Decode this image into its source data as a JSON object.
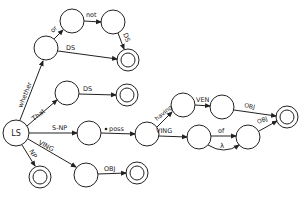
{
  "diagram": {
    "type": "augmented transition network",
    "stroke_color": "#222222",
    "background": "#ffffff",
    "nodes": [
      {
        "id": "LS",
        "label": "LS",
        "x": 16,
        "y": 133,
        "r": 13,
        "final": false
      },
      {
        "id": "n1",
        "label": "",
        "x": 46,
        "y": 48,
        "r": 12,
        "final": false
      },
      {
        "id": "n2",
        "label": "",
        "x": 72,
        "y": 21,
        "r": 12,
        "final": false
      },
      {
        "id": "n3",
        "label": "",
        "x": 113,
        "y": 22,
        "r": 12,
        "final": false
      },
      {
        "id": "f1",
        "label": "",
        "x": 128,
        "y": 60,
        "r": 11,
        "final": true
      },
      {
        "id": "n4",
        "label": "",
        "x": 67,
        "y": 93,
        "r": 12,
        "final": false
      },
      {
        "id": "f2",
        "label": "",
        "x": 127,
        "y": 95,
        "r": 11,
        "final": true
      },
      {
        "id": "n5",
        "label": "",
        "x": 89,
        "y": 133,
        "r": 12,
        "final": false
      },
      {
        "id": "n6",
        "label": "",
        "x": 147,
        "y": 134,
        "r": 12,
        "final": false
      },
      {
        "id": "n7",
        "label": "",
        "x": 183,
        "y": 105,
        "r": 12,
        "final": false
      },
      {
        "id": "n8",
        "label": "",
        "x": 222,
        "y": 107,
        "r": 12,
        "final": false
      },
      {
        "id": "f3",
        "label": "",
        "x": 287,
        "y": 117,
        "r": 11,
        "final": true
      },
      {
        "id": "n9",
        "label": "",
        "x": 199,
        "y": 137,
        "r": 12,
        "final": false
      },
      {
        "id": "n10",
        "label": "",
        "x": 248,
        "y": 137,
        "r": 12,
        "final": false
      },
      {
        "id": "f4",
        "label": "",
        "x": 40,
        "y": 177,
        "r": 11,
        "final": true
      },
      {
        "id": "n11",
        "label": "",
        "x": 86,
        "y": 175,
        "r": 12,
        "final": false
      },
      {
        "id": "f5",
        "label": "",
        "x": 137,
        "y": 173,
        "r": 11,
        "final": true
      }
    ],
    "edges": [
      {
        "from": "LS",
        "to": "n1",
        "label": "whether"
      },
      {
        "from": "n1",
        "to": "n2",
        "label": "or"
      },
      {
        "from": "n2",
        "to": "n3",
        "label": "not"
      },
      {
        "from": "n3",
        "to": "f1",
        "label": "DS"
      },
      {
        "from": "n1",
        "to": "f1",
        "label": "DS"
      },
      {
        "from": "LS",
        "to": "n4",
        "label": "That"
      },
      {
        "from": "n4",
        "to": "f2",
        "label": "DS"
      },
      {
        "from": "LS",
        "to": "n5",
        "label": "S-NP"
      },
      {
        "from": "n5",
        "to": "n6",
        "label": "poss"
      },
      {
        "from": "n6",
        "to": "n7",
        "label": "having"
      },
      {
        "from": "n7",
        "to": "n8",
        "label": "VEN"
      },
      {
        "from": "n8",
        "to": "f3",
        "label": "OBJ"
      },
      {
        "from": "n6",
        "to": "n9",
        "label": "VING"
      },
      {
        "from": "n9",
        "to": "n10",
        "label": "of"
      },
      {
        "from": "n9",
        "to": "n10",
        "label": "λ",
        "curved": true
      },
      {
        "from": "n10",
        "to": "f3",
        "label": "OBJ"
      },
      {
        "from": "LS",
        "to": "f4",
        "label": "NP"
      },
      {
        "from": "LS",
        "to": "n11",
        "label": "VING"
      },
      {
        "from": "n11",
        "to": "f5",
        "label": "OBJ"
      }
    ]
  },
  "labels": {
    "ls": "LS",
    "whether": "whether",
    "or": "or",
    "not": "not",
    "ds_top": "DS",
    "ds_mid": "DS",
    "that": "That",
    "ds_that": "DS",
    "snp": "S-NP",
    "poss": "poss",
    "having": "having",
    "ven": "VEN",
    "obj_upper": "OBJ",
    "ving_mid": "VING",
    "of": "of",
    "lambda": "λ",
    "obj_lower": "OBJ",
    "np": "NP",
    "ving_low": "VING",
    "obj_bottom": "OBJ"
  }
}
